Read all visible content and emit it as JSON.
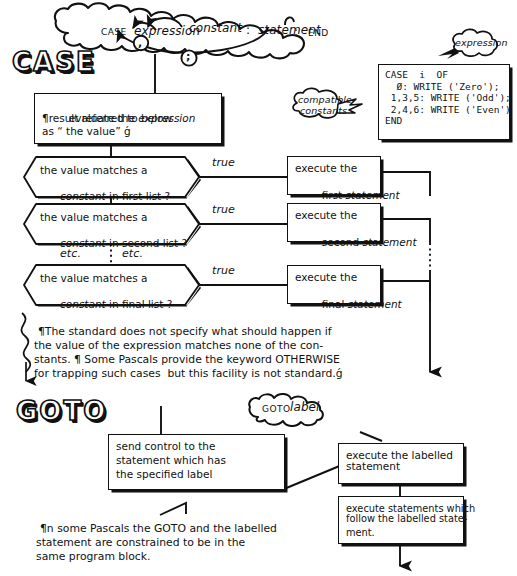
{
  "page": {
    "bg_color": "#ffffff",
    "ink_color": "#111111"
  },
  "sections": [
    {
      "id": "case",
      "heading": "CASE"
    },
    {
      "id": "goto",
      "heading": "GOTO"
    }
  ],
  "case_section": {
    "heading": "CASE",
    "syntax_cloud": {
      "name": "case-syntax-cloud",
      "tokens": [
        {
          "text": "CASE",
          "style": "smallcaps"
        },
        {
          "text": "expression",
          "style": "italic"
        },
        {
          "text": "constant",
          "style": "italic"
        },
        {
          "text": ":",
          "style": "plain"
        },
        {
          "text": "statement",
          "style": "italic"
        },
        {
          "text": ":",
          "style": "plain"
        },
        {
          "text": "END",
          "style": "smallcaps"
        }
      ],
      "loop_markers": [
        {
          "symbol": ",",
          "name": "comma-loop-marker"
        },
        {
          "symbol": ";",
          "name": "semicolon-loop-marker"
        }
      ]
    },
    "callouts": [
      {
        "name": "expression-callout",
        "text": "expression"
      },
      {
        "name": "compatible-constants-callout",
        "line1": "compatible",
        "line2": "constants"
      }
    ],
    "code_example": {
      "name": "case-code-example",
      "lines": [
        "CASE  i  OF",
        "  Ø: WRITE ('Zero');",
        " 1,3,5: WRITE ('Odd');",
        " 2,4,6: WRITE ('Even')",
        "END"
      ]
    },
    "evaluate_box": {
      "name": "evaluate-expression-box",
      "line1": "evaluate the ",
      "line1_em": "expression",
      "line2": "¶result referred to below",
      "line3": "as “ the value” ǵ"
    },
    "branches": [
      {
        "name": "branch-first",
        "decision": {
          "name": "decision-first-list",
          "line1": "the value matches a",
          "line2_em": "constant",
          "line2_rest": " in first list ?"
        },
        "edge_label": "true",
        "action": {
          "name": "action-first-statement",
          "line1": "execute the",
          "line2": "first ",
          "line2_em": "statement"
        }
      },
      {
        "name": "branch-second",
        "decision": {
          "name": "decision-second-list",
          "line1": "the value matches a",
          "line2_em": "constant",
          "line2_rest": " in second list ?"
        },
        "edge_label": "true",
        "action": {
          "name": "action-second-statement",
          "line1": "execute the",
          "line2": "second ",
          "line2_em": "statement"
        }
      },
      {
        "name": "branch-final",
        "decision": {
          "name": "decision-final-list",
          "line1": "the value matches a",
          "line2_em": "constant",
          "line2_rest": " in final list ?"
        },
        "edge_label": "true",
        "action": {
          "name": "action-final-statement",
          "line1": "execute the",
          "line2": "final ",
          "line2_em": "statement"
        }
      }
    ],
    "etc_labels": [
      {
        "name": "etc-label-left",
        "text": "etc."
      },
      {
        "name": "etc-label-right",
        "text": "etc."
      }
    ],
    "note": {
      "name": "case-standard-note",
      "line1": "¶The standard does not specify what should happen if",
      "line2": "the value of the expression matches none of the con-",
      "line3": "stants. ¶ Some Pascals provide the keyword OTHERWISE",
      "line4": "for trapping such cases  but this facility is not standard.ǵ"
    }
  },
  "goto_section": {
    "heading": "GOTO",
    "syntax_cloud": {
      "name": "goto-syntax-cloud",
      "tokens": [
        {
          "text": "GOTO",
          "style": "smallcaps"
        },
        {
          "text": "label",
          "style": "italic"
        }
      ]
    },
    "boxes": [
      {
        "name": "send-control-box",
        "line1": "send control to the",
        "line2": "statement which has",
        "line3": "the specified label"
      },
      {
        "name": "execute-labelled-statement-box",
        "line1": "execute the labelled",
        "line2": "statement"
      },
      {
        "name": "execute-following-statements-box",
        "line1": "execute statements which",
        "line2": "follow the labelled state-",
        "line3": "ment."
      }
    ],
    "note": {
      "name": "goto-block-note",
      "line1": "¶n some Pascals the GOTO and the labelled",
      "line2": "statement are constrained to be in the",
      "line3": "same program block."
    }
  }
}
